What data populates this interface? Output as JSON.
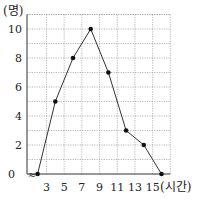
{
  "chart_data": {
    "type": "line",
    "title": "",
    "xlabel": "(시간)",
    "ylabel": "(명)",
    "x": [
      2,
      4,
      6,
      8,
      10,
      12,
      14,
      16
    ],
    "series": [
      {
        "name": "",
        "values": [
          0,
          5,
          8,
          10,
          7,
          3,
          2,
          0
        ]
      }
    ],
    "x_ticks": [
      3,
      5,
      7,
      9,
      11,
      13,
      15
    ],
    "y_ticks": [
      0,
      2,
      4,
      6,
      8,
      10
    ],
    "xlim": [
      0,
      17
    ],
    "ylim": [
      0,
      11
    ],
    "x_axis_break": true,
    "grid": true,
    "legend": null
  },
  "labels": {
    "y_unit": "(명)",
    "x_unit": "(시간)",
    "origin": "0",
    "break_symbol": "≈"
  },
  "colors": {
    "line": "#333333",
    "marker": "#111111",
    "grid": "#9a9a9a",
    "axis": "#333333"
  }
}
